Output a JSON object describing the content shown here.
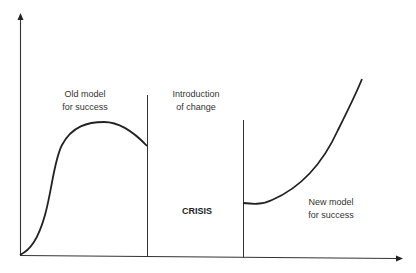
{
  "diagram": {
    "type": "change-curve",
    "axes": {
      "y_axis": {
        "label": "",
        "has_arrow": true
      },
      "x_axis": {
        "label": "",
        "has_arrow": true
      }
    },
    "phases": [
      {
        "id": "old-model",
        "label_line1": "Old model",
        "label_line2": "for success"
      },
      {
        "id": "introduction-of-change",
        "label_line1": "Introduction",
        "label_line2": "of change"
      },
      {
        "id": "crisis",
        "label": "CRISIS"
      },
      {
        "id": "new-model",
        "label_line1": "New model",
        "label_line2": "for success"
      }
    ],
    "curves": [
      {
        "name": "old-model-curve",
        "description": "S-shaped rise to a peak, then decline at onset of change"
      },
      {
        "name": "new-model-curve",
        "description": "Flat low start after crisis, then accelerating rise"
      }
    ],
    "colors": {
      "stroke": "#222222",
      "axis": "#333333",
      "text": "#333333",
      "background": "#ffffff"
    }
  }
}
